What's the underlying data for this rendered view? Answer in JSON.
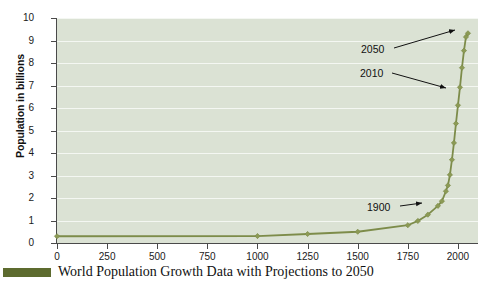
{
  "caption": {
    "text": "World Population Growth Data with Projections to 2050",
    "swatch_color": "#5d6b2f"
  },
  "style": {
    "plot_background": "#dbe2d4",
    "gridline_color": "#f4f7f2",
    "line_color": "#7d8c4a",
    "marker_color": "#8c9a55",
    "axis_color": "#4a4a4a",
    "text_color": "#111111"
  },
  "chart_data": {
    "type": "line",
    "title": "World Population Growth Data with Projections to 2050",
    "xlabel": "",
    "ylabel": "Population in billions",
    "xlim": [
      0,
      2100
    ],
    "ylim": [
      0,
      10
    ],
    "grid": true,
    "legend_position": "none",
    "xticks": [
      0,
      250,
      500,
      750,
      1000,
      1250,
      1500,
      1750,
      2000
    ],
    "yticks": [
      0,
      1,
      2,
      3,
      4,
      5,
      6,
      7,
      8,
      9,
      10
    ],
    "series": [
      {
        "name": "World population",
        "x": [
          0,
          1000,
          1250,
          1500,
          1750,
          1800,
          1850,
          1900,
          1920,
          1940,
          1950,
          1960,
          1970,
          1980,
          1990,
          2000,
          2010,
          2020,
          2030,
          2040,
          2050
        ],
        "values": [
          0.3,
          0.31,
          0.4,
          0.5,
          0.79,
          0.98,
          1.26,
          1.65,
          1.86,
          2.3,
          2.56,
          3.03,
          3.7,
          4.45,
          5.31,
          6.12,
          6.92,
          7.79,
          8.55,
          9.16,
          9.32
        ]
      }
    ],
    "annotations": [
      {
        "label": "1900",
        "x": 1900,
        "y": 1.65,
        "text_x_px": 367,
        "text_y_px": 202,
        "arrow_from_px": [
          400,
          206
        ],
        "arrow_to_px": [
          422,
          203
        ]
      },
      {
        "label": "2010",
        "x": 2010,
        "y": 6.92,
        "text_x_px": 360,
        "text_y_px": 68,
        "arrow_from_px": [
          392,
          73
        ],
        "arrow_to_px": [
          446,
          88
        ]
      },
      {
        "label": "2050",
        "x": 2050,
        "y": 9.32,
        "text_x_px": 361,
        "text_y_px": 44,
        "arrow_from_px": [
          394,
          48
        ],
        "arrow_to_px": [
          455,
          30
        ]
      }
    ]
  }
}
